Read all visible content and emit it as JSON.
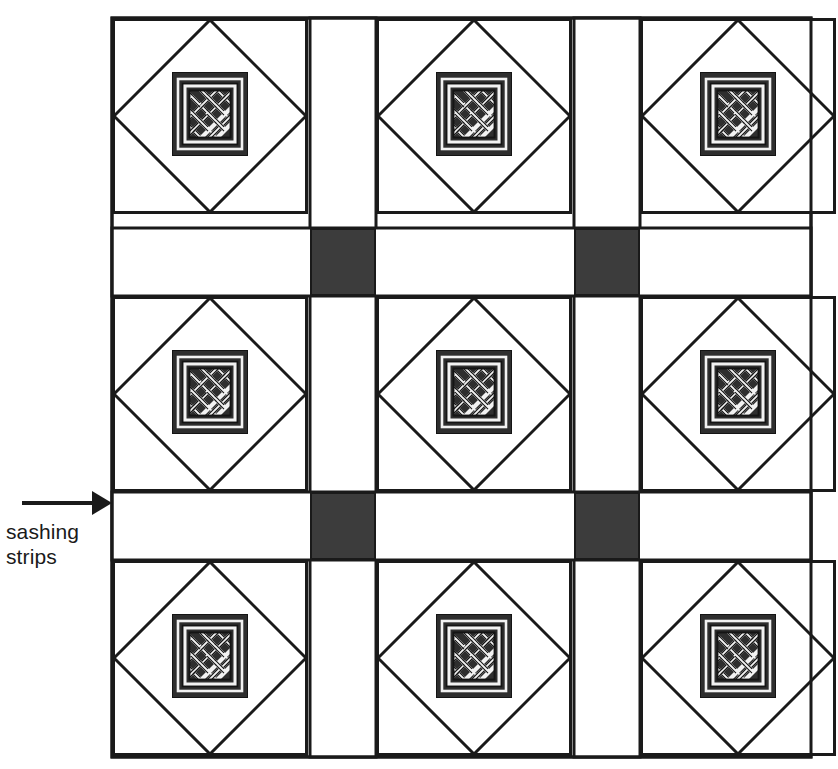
{
  "diagram": {
    "type": "quilt-block-layout",
    "annotation": {
      "label_line1": "sashing",
      "label_line2": "strips",
      "pointer": "arrow-right",
      "points_to": "horizontal-sashing-strip-row-2"
    },
    "colors": {
      "background": "#ffffff",
      "outline": "#1a1a1a",
      "cornerstone_fill": "#3c3c3c",
      "knot_panel_fill": "#2e2e2e",
      "knot_band_fill": "#ffffff",
      "knot_band_outline": "#141414",
      "label_text": "#1a1a1a"
    },
    "grid": {
      "rows": 3,
      "columns": 3,
      "block_count": 9,
      "sashing_rows": 2,
      "sashing_columns": 2,
      "cornerstone_count": 4,
      "outer_left": 112,
      "outer_top": 18,
      "outer_right": 811,
      "outer_bottom": 757,
      "block_size": 196,
      "sashing_width": 65,
      "column_starts": [
        112,
        376,
        640
      ],
      "row_starts": [
        18,
        296,
        560
      ],
      "sashing_column_starts": [
        310,
        574
      ],
      "sashing_row_starts": [
        228,
        492
      ],
      "sashing_row_height": 66,
      "sashing_column_width": 65
    },
    "block": {
      "name": "celtic-knot-square-in-square",
      "layers": [
        "outer-square",
        "inscribed-diamond",
        "knot-panel",
        "celtic-knot-interlace"
      ],
      "panel_inset_x": 60,
      "panel_top": 54,
      "panel_width": 76,
      "panel_height": 84
    },
    "elements": {
      "block_label": "quilt block",
      "cornerstone_label": "cornerstone square",
      "sashing_horizontal_label": "horizontal sashing strip",
      "sashing_vertical_label": "vertical sashing strip"
    }
  }
}
